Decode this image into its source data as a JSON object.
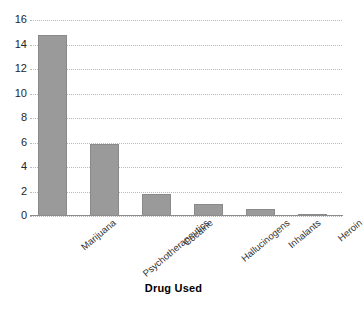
{
  "chart_data": {
    "type": "bar",
    "title": "",
    "xlabel": "Drug Used",
    "ylabel": "",
    "categories": [
      "Marijuana",
      "Psychotherapeutics",
      "Cocaine",
      "Hallucinogens",
      "Inhalants",
      "Heroin"
    ],
    "values": [
      14.8,
      5.9,
      1.8,
      1.0,
      0.6,
      0.2
    ],
    "ylim": [
      0,
      16
    ],
    "yticks": [
      0,
      2,
      4,
      6,
      8,
      10,
      12,
      14,
      16
    ],
    "ytick_labels": [
      "0",
      "2",
      "4",
      "6",
      "8",
      "10",
      "12",
      "14",
      "16"
    ],
    "grid": true,
    "grid_style": "dotted",
    "legend": false,
    "bar_color": "#9a9a9a",
    "grid_color": "#b9b9b9",
    "axis_color": "#8c8c8c",
    "background": "#ffffff"
  }
}
